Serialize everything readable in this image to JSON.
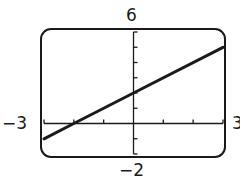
{
  "chart_data": {
    "type": "line",
    "title": "",
    "xlabel": "",
    "ylabel": "",
    "xlim": [
      -3,
      3
    ],
    "ylim": [
      -2,
      6
    ],
    "xticks": [
      -3,
      -2,
      -1,
      0,
      1,
      2,
      3
    ],
    "yticks": [
      -2,
      -1,
      0,
      1,
      2,
      3,
      4,
      5,
      6
    ],
    "grid": false,
    "legend": null,
    "window_labels": {
      "ymax": "6",
      "ymin": "−2",
      "xmin": "−3",
      "xmax": "3"
    },
    "series": [
      {
        "name": "y = x + 2",
        "x": [
          -3,
          -2,
          0,
          3
        ],
        "y": [
          -1,
          0,
          2,
          5
        ]
      }
    ],
    "colors": {
      "line": "#1a1a1a",
      "axis": "#1a1a1a",
      "frame": "#1a1a1a"
    }
  }
}
